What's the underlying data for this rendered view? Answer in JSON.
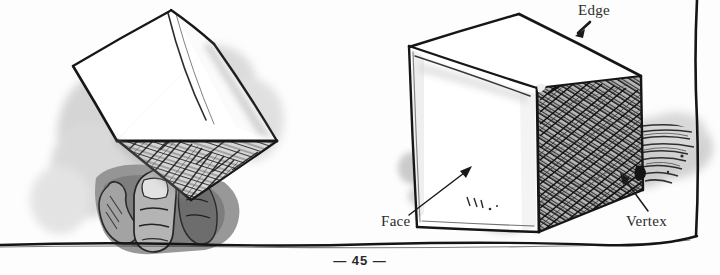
{
  "page": {
    "folio": "— 45 —",
    "background_color": "#fdfdfd",
    "ink_color": "#1c1c1c"
  },
  "figures": [
    {
      "name": "cube-held-in-hand",
      "description": "Hand-drawn ink-and-wash cube held from below by a hand, tilted, showing a white top face, a white left face and a hatched underside face, with a soft gray shadow wash behind it.",
      "labels": []
    },
    {
      "name": "cube-with-labels",
      "description": "Hand-drawn ink-and-wash cube resting on a surface, white top face, white left-front face, densely cross-hatched right face, cast shadow to the right.",
      "labels": [
        "Edge",
        "Face",
        "Vertex"
      ]
    }
  ],
  "annotations": {
    "edge": {
      "label": "Edge",
      "target": "top-right-edge-of-cube"
    },
    "face": {
      "label": "Face",
      "target": "left-front-white-face"
    },
    "vertex": {
      "label": "Vertex",
      "target": "bottom-right-corner-point"
    }
  },
  "colors": {
    "ink": "#1c1c1c",
    "wash_light": "#c9c9c9",
    "wash_mid": "#9b9b9b",
    "wash_dark": "#6e6e6e",
    "paper": "#fdfdfd"
  }
}
